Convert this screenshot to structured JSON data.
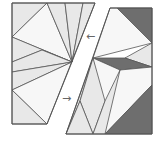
{
  "diagram": {
    "title": "",
    "colors": {
      "light": "#e8e8e8",
      "white": "#f7f7f7",
      "dark": "#6e6e6e",
      "stroke": "#555555",
      "background": "#ffffff"
    },
    "left_piece": {
      "outline": "12,3 95,3 47,124 12,124",
      "tiles": [
        {
          "name": "tile-top-left-corner",
          "points": "12,3 47,3 12,37",
          "fill": "light"
        },
        {
          "name": "tile-top-large",
          "points": "47,3 12,37 72,62",
          "fill": "white"
        },
        {
          "name": "tile-top-strip-a",
          "points": "47,3 65,3 72,62",
          "fill": "light"
        },
        {
          "name": "tile-top-strip-b",
          "points": "65,3 83,3 72,62",
          "fill": "light"
        },
        {
          "name": "tile-top-strip-c",
          "points": "83,3 95,3 72,62",
          "fill": "light"
        },
        {
          "name": "tile-mid-upper",
          "points": "12,37 72,62 42,50 12,62",
          "fill": "light"
        },
        {
          "name": "tile-mid-band",
          "points": "12,62 42,50 72,62 12,72",
          "fill": "light"
        },
        {
          "name": "tile-mid-lower",
          "points": "12,72 72,62 12,90",
          "fill": "light"
        },
        {
          "name": "tile-lower-large",
          "points": "12,90 72,62 47,124",
          "fill": "white"
        },
        {
          "name": "tile-bottom-left",
          "points": "12,90 47,124 12,124",
          "fill": "light"
        }
      ]
    },
    "right_piece": {
      "outline": "110,8 152,8 152,134 66,134",
      "tiles": [
        {
          "name": "tile-top-dark",
          "points": "117,8 152,8 152,43",
          "fill": "dark"
        },
        {
          "name": "tile-upper-white",
          "points": "110,8 117,8 152,43 93,58",
          "fill": "white"
        },
        {
          "name": "tile-right-light",
          "points": "152,43 152,67 125,58",
          "fill": "light"
        },
        {
          "name": "tile-mid-dark",
          "points": "93,58 125,58 152,67 120,70",
          "fill": "dark"
        },
        {
          "name": "tile-lower-white",
          "points": "93,58 120,70 152,67 152,85 105,134",
          "fill": "white"
        },
        {
          "name": "tile-bottom-right-dark",
          "points": "152,85 152,134 105,134",
          "fill": "dark"
        },
        {
          "name": "tile-diamond-left",
          "points": "93,58 80,101 66,134",
          "fill": "light"
        },
        {
          "name": "tile-diamond-center",
          "points": "93,58 105,101 93,134 80,101",
          "fill": "light"
        },
        {
          "name": "tile-bottom-tri-a",
          "points": "66,134 80,101 93,134",
          "fill": "light"
        },
        {
          "name": "tile-bottom-tri-b",
          "points": "93,134 105,101 120,70 105,134",
          "fill": "light"
        }
      ]
    },
    "arrows": [
      {
        "name": "arrow-left",
        "glyph": "←",
        "x": 86,
        "y": 40
      },
      {
        "name": "arrow-right",
        "glyph": "→",
        "x": 62,
        "y": 102
      }
    ]
  }
}
